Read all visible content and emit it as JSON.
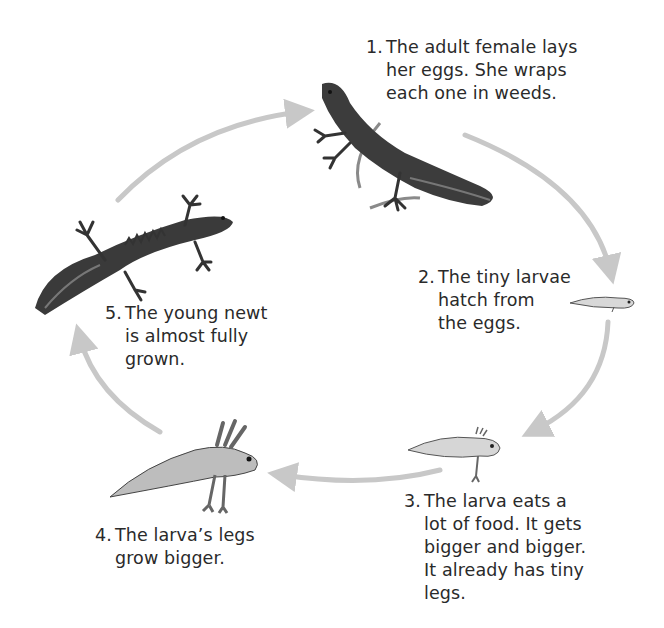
{
  "diagram": {
    "type": "life-cycle",
    "subject": "newt",
    "arrow_color": "#c8c8c8",
    "text_color": "#2a2a2a",
    "stages": [
      {
        "number": "1.",
        "lines": [
          "The adult female lays",
          "her eggs. She wraps",
          "each one in weeds."
        ],
        "illustration": "adult-female-newt"
      },
      {
        "number": "2.",
        "lines": [
          "The tiny larvae",
          "hatch from",
          "the eggs."
        ],
        "illustration": "tiny-larva"
      },
      {
        "number": "3.",
        "lines": [
          "The larva eats a",
          "lot of food. It gets",
          "bigger and bigger.",
          "It already has tiny",
          "legs."
        ],
        "illustration": "larva-with-tiny-legs"
      },
      {
        "number": "4.",
        "lines": [
          "The larva’s legs",
          "grow bigger."
        ],
        "illustration": "larva-with-gills-and-legs"
      },
      {
        "number": "5.",
        "lines": [
          "The young newt",
          "is almost fully",
          "grown."
        ],
        "illustration": "young-newt"
      }
    ]
  }
}
